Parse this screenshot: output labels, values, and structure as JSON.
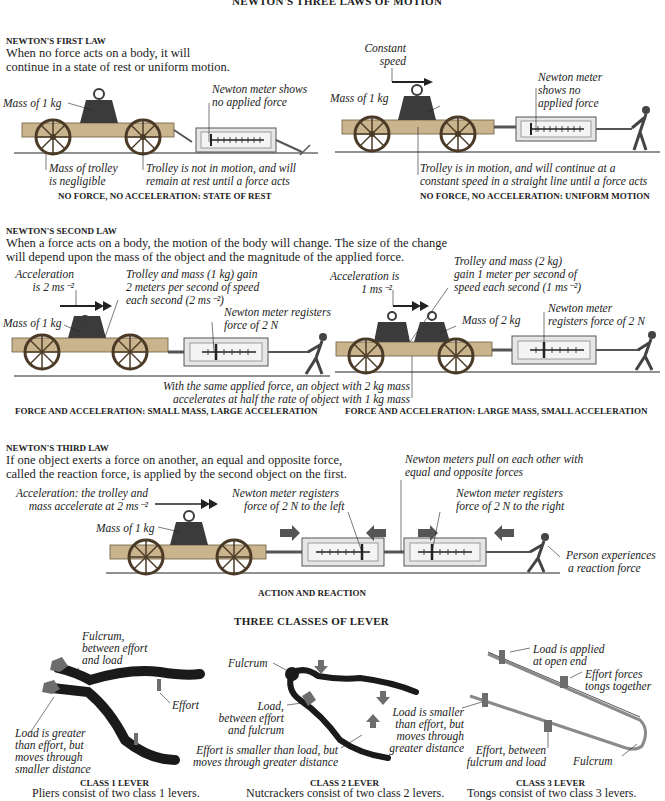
{
  "page_title": "NEWTON'S THREE LAWS OF MOTION",
  "first_law": {
    "heading": "NEWTON'S FIRST LAW",
    "text_line1": "When no force acts on a body, it will",
    "text_line2": "continue in a state of rest or uniform motion.",
    "rest_panel": {
      "mass_label": "Mass of 1 kg",
      "meter_label_line1": "Newton meter shows",
      "meter_label_line2": "no applied force",
      "trolley_mass_line1": "Mass of trolley",
      "trolley_mass_line2": "is negligible",
      "state_line1": "Trolley is not in motion, and will",
      "state_line2": "remain at rest until a force acts",
      "caption": "NO FORCE, NO ACCELERATION: STATE OF REST"
    },
    "motion_panel": {
      "speed_line1": "Constant",
      "speed_line2": "speed",
      "mass_label": "Mass of 1 kg",
      "meter_label_line1": "Newton meter",
      "meter_label_line2": "shows no",
      "meter_label_line3": "applied force",
      "state_line1": "Trolley is in motion, and will continue at a",
      "state_line2": "constant speed in a straight line until a force acts",
      "caption": "NO FORCE, NO ACCELERATION: UNIFORM MOTION"
    }
  },
  "second_law": {
    "heading": "NEWTON'S SECOND LAW",
    "text_line1": "When a force acts on a body, the motion of the body will change. The size of the change",
    "text_line2": "will depend upon the mass of the object and the magnitude of the applied force.",
    "small_mass_panel": {
      "accel_line1": "Acceleration",
      "accel_line2": "is 2 ms⁻²",
      "gain_line1": "Trolley and mass (1 kg) gain",
      "gain_line2": "2 meters per second of speed",
      "gain_line3": "each second (2 ms⁻²)",
      "mass_label": "Mass of 1 kg",
      "meter_label_line1": "Newton meter registers",
      "meter_label_line2": "force of 2 N",
      "caption": "FORCE AND ACCELERATION: SMALL MASS, LARGE ACCELERATION"
    },
    "large_mass_panel": {
      "accel_line1": "Acceleration is",
      "accel_line2": "1 ms⁻²",
      "gain_line1": "Trolley and mass (2 kg)",
      "gain_line2": "gain 1 meter per second of",
      "gain_line3": "speed each second (1 ms⁻²)",
      "mass_label": "Mass of 2 kg",
      "meter_label_line1": "Newton meter",
      "meter_label_line2": "registers force of 2 N",
      "caption": "FORCE AND ACCELERATION: LARGE MASS, SMALL ACCELERATION"
    },
    "comparison_line1": "With the same applied force, an object with 2 kg mass",
    "comparison_line2": "accelerates at half the rate of object with 1 kg mass"
  },
  "third_law": {
    "heading": "NEWTON'S THIRD LAW",
    "text_line1": "If one object exerts a force on another, an equal and opposite force,",
    "text_line2": "called the reaction force, is applied by the second object on the first.",
    "accel_line1": "Acceleration: the trolley and",
    "accel_line2": "mass accelerate at 2 ms⁻²",
    "mass_label": "Mass of 1 kg",
    "left_meter_line1": "Newton meter registers",
    "left_meter_line2": "force of 2 N to the left",
    "pull_line1": "Newton meters pull on each other with",
    "pull_line2": "equal and opposite forces",
    "right_meter_line1": "Newton meter registers",
    "right_meter_line2": "force of 2 N to the right",
    "person_line1": "Person experiences",
    "person_line2": "a reaction force",
    "caption": "ACTION AND REACTION"
  },
  "levers": {
    "title": "THREE CLASSES OF LEVER",
    "class1": {
      "fulcrum_line1": "Fulcrum,",
      "fulcrum_line2": "between effort",
      "fulcrum_line3": "and load",
      "effort": "Effort",
      "load_line1": "Load is greater",
      "load_line2": "than effort, but",
      "load_line3": "moves through",
      "load_line4": "smaller distance",
      "caption": "CLASS 1 LEVER",
      "subcaption": "Pliers consist of two class 1 levers."
    },
    "class2": {
      "fulcrum": "Fulcrum",
      "load_line1": "Load,",
      "load_line2": "between effort",
      "load_line3": "and fulcrum",
      "effort_line1": "Effort is smaller than load, but",
      "effort_line2": "moves through greater distance",
      "load_small_line1": "Load is smaller",
      "load_small_line2": "than effort, but",
      "load_small_line3": "moves through",
      "load_small_line4": "greater distance",
      "caption": "CLASS 2 LEVER",
      "subcaption": "Nutcrackers consist of two class 2 levers."
    },
    "class3": {
      "load_line1": "Load is applied",
      "load_line2": "at open end",
      "effort_forces_line1": "Effort forces",
      "effort_forces_line2": "tongs together",
      "effort_line1": "Effort, between",
      "effort_line2": "fulcrum and load",
      "fulcrum": "Fulcrum",
      "caption": "CLASS 3 LEVER",
      "subcaption": "Tongs consist of two class 3 levers."
    }
  },
  "colors": {
    "ink": "#222222",
    "wood": "#c9b48e",
    "wood_dark": "#6e5a3c",
    "mass": "#3b3b3b",
    "meter_frame": "#d8d8d8",
    "arrow_grey": "#555555",
    "lever_dark": "#1a1a1a",
    "lever_marker": "#6d6d6d"
  }
}
